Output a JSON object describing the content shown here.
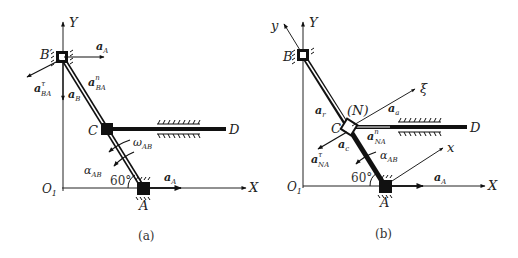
{
  "panel_a": {
    "caption": "(a)",
    "axis_x": "X",
    "axis_y": "Y",
    "origin": "O",
    "origin_sub": "1",
    "point_B": "B",
    "point_C": "C",
    "point_D": "D",
    "point_A": "A",
    "angle": "60°",
    "vec_aA_top": {
      "base": "a",
      "sub": "A"
    },
    "vec_aA_bottom": {
      "base": "a",
      "sub": "A"
    },
    "vec_aBA_tau": {
      "base": "a",
      "sup": "τ",
      "sub": "BA"
    },
    "vec_aBA_n": {
      "base": "a",
      "sup": "n",
      "sub": "BA"
    },
    "vec_aB": {
      "base": "a",
      "sub": "B"
    },
    "omega": {
      "base": "ω",
      "sub": "AB"
    },
    "alpha": {
      "base": "α",
      "sub": "AB"
    }
  },
  "panel_b": {
    "caption": "(b)",
    "axis_x": "X",
    "axis_y": "Y",
    "axis_y_rot": "y",
    "axis_x_rot": "x",
    "axis_xi": "ξ",
    "origin": "O",
    "origin_sub": "1",
    "point_B": "B",
    "point_C": "C",
    "point_N": "(N)",
    "point_D": "D",
    "point_A": "A",
    "angle": "60°",
    "vec_ar": {
      "base": "a",
      "sub": "r"
    },
    "vec_aa": {
      "base": "a",
      "sub": "a"
    },
    "vec_aNA_n": {
      "base": "a",
      "sup": "n",
      "sub": "NA"
    },
    "vec_aNA_tau": {
      "base": "a",
      "sup": "τ",
      "sub": "NA"
    },
    "vec_ac": {
      "base": "a",
      "sub": "c"
    },
    "vec_aA": {
      "base": "a",
      "sub": "A"
    },
    "alpha": {
      "base": "α",
      "sub": "AB"
    }
  }
}
